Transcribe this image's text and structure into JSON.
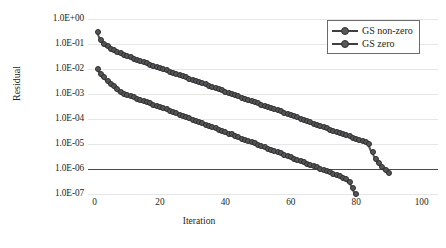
{
  "chart_data": {
    "type": "line",
    "title": "",
    "xlabel": "Iteration",
    "ylabel": "Residual",
    "yscale": "log",
    "xlim": [
      -2,
      105
    ],
    "ylim": [
      1e-07,
      1.0
    ],
    "grid": true,
    "legend_position": "top-right",
    "emphasis_line": {
      "y": 1e-06,
      "label": "1.0E-06 tolerance"
    },
    "x_ticks": [
      "0",
      "20",
      "40",
      "60",
      "80",
      "100"
    ],
    "x_tick_values": [
      0,
      20,
      40,
      60,
      80,
      100
    ],
    "y_ticks": [
      "1.0E+00",
      "1.0E-01",
      "1.0E-02",
      "1.0E-03",
      "1.0E-04",
      "1.0E-05",
      "1.0E-06",
      "1.0E-07"
    ],
    "y_tick_values": [
      1.0,
      0.1,
      0.01,
      0.001,
      0.0001,
      1e-05,
      1e-06,
      1e-07
    ],
    "series": [
      {
        "name": "GS non-zero",
        "marker": "circle",
        "color": "#555557",
        "x": [
          1,
          2,
          3,
          4,
          5,
          6,
          7,
          8,
          9,
          10,
          11,
          12,
          13,
          14,
          15,
          16,
          17,
          18,
          19,
          20,
          21,
          22,
          23,
          24,
          25,
          26,
          27,
          28,
          29,
          30,
          31,
          32,
          33,
          34,
          35,
          36,
          37,
          38,
          39,
          40,
          41,
          42,
          43,
          44,
          45,
          46,
          47,
          48,
          49,
          50,
          51,
          52,
          53,
          54,
          55,
          56,
          57,
          58,
          59,
          60,
          61,
          62,
          63,
          64,
          65,
          66,
          67,
          68,
          69,
          70,
          71,
          72,
          73,
          74,
          75,
          76,
          77,
          78,
          79,
          80,
          81,
          82,
          83,
          84,
          85,
          86,
          87,
          88,
          89,
          90
        ],
        "values": [
          0.3,
          0.14,
          0.1,
          0.08,
          0.066,
          0.056,
          0.048,
          0.042,
          0.037,
          0.033,
          0.029,
          0.026,
          0.023,
          0.021,
          0.019,
          0.017,
          0.015,
          0.0135,
          0.012,
          0.011,
          0.0098,
          0.0088,
          0.0079,
          0.0071,
          0.0064,
          0.0057,
          0.0051,
          0.0046,
          0.0041,
          0.0037,
          0.0033,
          0.003,
          0.0027,
          0.0024,
          0.0021,
          0.0019,
          0.0017,
          0.00155,
          0.0014,
          0.00125,
          0.0011,
          0.001,
          0.0009,
          0.00081,
          0.00072,
          0.00065,
          0.00058,
          0.00052,
          0.00047,
          0.00042,
          0.00038,
          0.00034,
          0.0003,
          0.00027,
          0.00024,
          0.00022,
          0.0002,
          0.00018,
          0.00016,
          0.00014,
          0.00013,
          0.000115,
          0.0001,
          9.2e-05,
          8.2e-05,
          7.4e-05,
          6.6e-05,
          5.9e-05,
          5.3e-05,
          4.8e-05,
          4.3e-05,
          3.8e-05,
          3.4e-05,
          3.1e-05,
          2.7e-05,
          2.5e-05,
          2.2e-05,
          2e-05,
          1.8e-05,
          1.6e-05,
          1.4e-05,
          1.3e-05,
          1.15e-05,
          1e-05,
          5e-06,
          2.6e-06,
          1.7e-06,
          1.2e-06,
          9e-07,
          7e-07
        ]
      },
      {
        "name": "GS zero",
        "marker": "circle",
        "color": "#555557",
        "x": [
          1,
          2,
          3,
          4,
          5,
          6,
          7,
          8,
          9,
          10,
          11,
          12,
          13,
          14,
          15,
          16,
          17,
          18,
          19,
          20,
          21,
          22,
          23,
          24,
          25,
          26,
          27,
          28,
          29,
          30,
          31,
          32,
          33,
          34,
          35,
          36,
          37,
          38,
          39,
          40,
          41,
          42,
          43,
          44,
          45,
          46,
          47,
          48,
          49,
          50,
          51,
          52,
          53,
          54,
          55,
          56,
          57,
          58,
          59,
          60,
          61,
          62,
          63,
          64,
          65,
          66,
          67,
          68,
          69,
          70,
          71,
          72,
          73,
          74,
          75,
          76,
          77,
          78,
          79,
          80
        ],
        "values": [
          0.01,
          0.0065,
          0.0046,
          0.0034,
          0.0025,
          0.002,
          0.0016,
          0.00115,
          0.001,
          0.00092,
          0.00082,
          0.00074,
          0.00066,
          0.00059,
          0.00053,
          0.00047,
          0.00042,
          0.00038,
          0.00034,
          0.0003,
          0.00027,
          0.00024,
          0.00021,
          0.00019,
          0.00017,
          0.00015,
          0.000135,
          0.00012,
          0.000105,
          9.4e-05,
          8.4e-05,
          7.5e-05,
          6.7e-05,
          6e-05,
          5.3e-05,
          4.7e-05,
          4.2e-05,
          3.8e-05,
          3.3e-05,
          3e-05,
          2.6e-05,
          2.4e-05,
          2.1e-05,
          1.9e-05,
          1.65e-05,
          1.5e-05,
          1.3e-05,
          1.2e-05,
          1.05e-05,
          9.4e-06,
          8.3e-06,
          7.4e-06,
          6.6e-06,
          5.9e-06,
          5.2e-06,
          4.7e-06,
          4.2e-06,
          3.7e-06,
          3.3e-06,
          2.9e-06,
          2.6e-06,
          2.3e-06,
          2.1e-06,
          1.85e-06,
          1.65e-06,
          1.45e-06,
          1.3e-06,
          1.15e-06,
          1e-06,
          9.2e-07,
          8.2e-07,
          7.3e-07,
          6.5e-07,
          5.7e-07,
          5.1e-07,
          4.5e-07,
          4e-07,
          3e-07,
          1.8e-07,
          1e-07
        ]
      }
    ]
  },
  "legend": {
    "items": [
      {
        "label": "GS non-zero"
      },
      {
        "label": "GS zero"
      }
    ]
  }
}
